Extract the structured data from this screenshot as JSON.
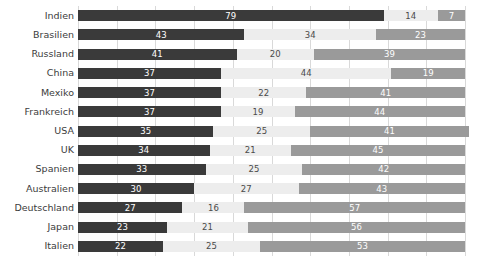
{
  "chart_data": {
    "type": "bar",
    "subtype": "stacked-horizontal-100-percent",
    "title": "",
    "subtitle": "",
    "xlabel": "",
    "ylabel": "",
    "xlim": [
      0,
      100
    ],
    "grid": true,
    "grid_interval": 10,
    "legend_position": "none",
    "orientation": "horizontal",
    "stacked": true,
    "categories": [
      "Indien",
      "Brasilien",
      "Russland",
      "China",
      "Mexiko",
      "Frankreich",
      "USA",
      "UK",
      "Spanien",
      "Australien",
      "Deutschland",
      "Japan",
      "Italien"
    ],
    "series": [
      {
        "name": "segment-1",
        "color": "#3a3a3a",
        "label_color": "#ffffff",
        "values": [
          79,
          43,
          41,
          37,
          37,
          37,
          35,
          34,
          33,
          30,
          27,
          23,
          22
        ]
      },
      {
        "name": "segment-2",
        "color": "#ededed",
        "label_color": "#4a4a4a",
        "values": [
          14,
          34,
          20,
          44,
          22,
          19,
          25,
          21,
          25,
          27,
          16,
          21,
          25
        ]
      },
      {
        "name": "segment-3",
        "color": "#9a9a9a",
        "label_color": "#ffffff",
        "values": [
          7,
          23,
          39,
          19,
          41,
          44,
          41,
          45,
          42,
          43,
          57,
          56,
          53
        ]
      }
    ],
    "axis_tick_labels": [],
    "annotations": []
  },
  "colors": {
    "segment_1": "#3a3a3a",
    "segment_2": "#ededed",
    "segment_3": "#9a9a9a",
    "gridline": "#d9d9d9",
    "category_label": "#3c3c3c",
    "background": "#ffffff"
  }
}
